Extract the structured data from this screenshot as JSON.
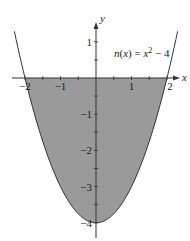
{
  "chart_data": {
    "type": "area",
    "title": "",
    "function_label": "n(x) = x² − 4",
    "function_label_parts": {
      "name": "n",
      "var": "x",
      "eq": " = ",
      "base": "x",
      "exp": "2",
      "rest": " − 4"
    },
    "xlabel": "x",
    "ylabel": "y",
    "xlim": [
      -2.3,
      2.3
    ],
    "ylim": [
      -4.4,
      1.7
    ],
    "x_ticks": [
      -2,
      -1.5,
      -1,
      -0.5,
      0.5,
      1,
      1.5,
      2
    ],
    "x_tick_labels": [
      {
        "value": -2,
        "label": "−2"
      },
      {
        "value": -1,
        "label": "−1"
      },
      {
        "value": 1,
        "label": "1"
      },
      {
        "value": 2,
        "label": "2"
      }
    ],
    "y_ticks": [
      1,
      0.5,
      -0.5,
      -1,
      -1.5,
      -2,
      -2.5,
      -3,
      -3.5,
      -4
    ],
    "y_tick_labels": [
      {
        "value": 1,
        "label": "1"
      },
      {
        "value": -1,
        "label": "−1"
      },
      {
        "value": -2,
        "label": "−2"
      },
      {
        "value": -3,
        "label": "−3"
      },
      {
        "value": -4,
        "label": "−4"
      }
    ],
    "series": [
      {
        "name": "n(x) = x^2 - 4",
        "x": [
          -2.3,
          -2,
          -1.5,
          -1,
          -0.5,
          0,
          0.5,
          1,
          1.5,
          2,
          2.3
        ],
        "values": [
          1.29,
          0,
          -1.75,
          -3,
          -3.75,
          -4,
          -3.75,
          -3,
          -1.75,
          0,
          1.29
        ]
      }
    ],
    "shaded_region": {
      "between": [
        "n(x)",
        "x-axis"
      ],
      "x_from": -2,
      "x_to": 2,
      "color": "#9a9a9a"
    },
    "grid": false,
    "legend": "none",
    "colors": {
      "curve": "#333333",
      "fill": "#9a9a9a",
      "axis": "#333333"
    }
  }
}
